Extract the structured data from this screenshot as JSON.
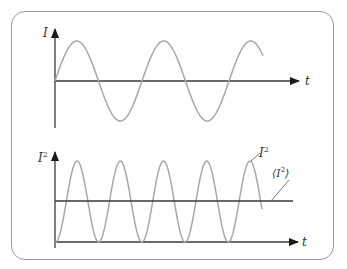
{
  "figure": {
    "colors": {
      "frame": "#9a9a9a",
      "axis": "#3a3a3a",
      "curve": "#a8a8a8",
      "text": "#333333"
    },
    "top_plot": {
      "y_label": "I",
      "x_label": "t",
      "curve": "sine",
      "description": "Current I oscillating sinusoidally about zero"
    },
    "bottom_plot": {
      "y_label": "I",
      "y_label_sup": "2",
      "x_label": "t",
      "curve_label": "I",
      "curve_label_sup": "2",
      "mean_label_open": "⟨I",
      "mean_label_sup": "2",
      "mean_label_close": "⟩",
      "description": "I squared oscillates between 0 and max; horizontal line is its time average"
    }
  }
}
